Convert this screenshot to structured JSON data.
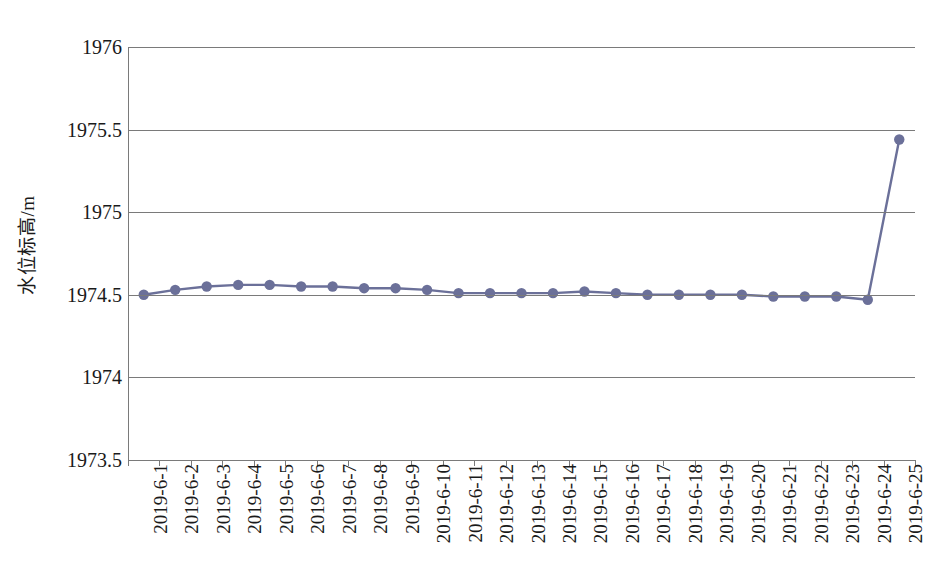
{
  "chart_data": {
    "type": "line",
    "title": "",
    "subtitle": "",
    "xlabel": "",
    "ylabel": "水位标高/m",
    "ylim": [
      1973.5,
      1976
    ],
    "y_ticks": [
      "1973.5",
      "1974",
      "1974.5",
      "1975",
      "1975.5",
      "1976"
    ],
    "y_tick_values": [
      1973.5,
      1974,
      1974.5,
      1975,
      1975.5,
      1976
    ],
    "grid": "horizontal",
    "legend": "none",
    "series_color": "#6b7099",
    "marker": "circle",
    "categories": [
      "2019-6-1",
      "2019-6-2",
      "2019-6-3",
      "2019-6-4",
      "2019-6-5",
      "2019-6-6",
      "2019-6-7",
      "2019-6-8",
      "2019-6-9",
      "2019-6-10",
      "2019-6-11",
      "2019-6-12",
      "2019-6-13",
      "2019-6-14",
      "2019-6-15",
      "2019-6-16",
      "2019-6-17",
      "2019-6-18",
      "2019-6-19",
      "2019-6-20",
      "2019-6-21",
      "2019-6-22",
      "2019-6-23",
      "2019-6-24",
      "2019-6-25"
    ],
    "values": [
      1974.5,
      1974.53,
      1974.55,
      1974.56,
      1974.56,
      1974.55,
      1974.55,
      1974.54,
      1974.54,
      1974.53,
      1974.51,
      1974.51,
      1974.51,
      1974.51,
      1974.52,
      1974.51,
      1974.5,
      1974.5,
      1974.5,
      1974.5,
      1974.49,
      1974.49,
      1974.49,
      1974.47,
      1975.44
    ],
    "series": [
      {
        "name": "水位标高",
        "values": [
          1974.5,
          1974.53,
          1974.55,
          1974.56,
          1974.56,
          1974.55,
          1974.55,
          1974.54,
          1974.54,
          1974.53,
          1974.51,
          1974.51,
          1974.51,
          1974.51,
          1974.52,
          1974.51,
          1974.5,
          1974.5,
          1974.5,
          1974.5,
          1974.49,
          1974.49,
          1974.49,
          1974.47,
          1975.44
        ]
      }
    ]
  }
}
